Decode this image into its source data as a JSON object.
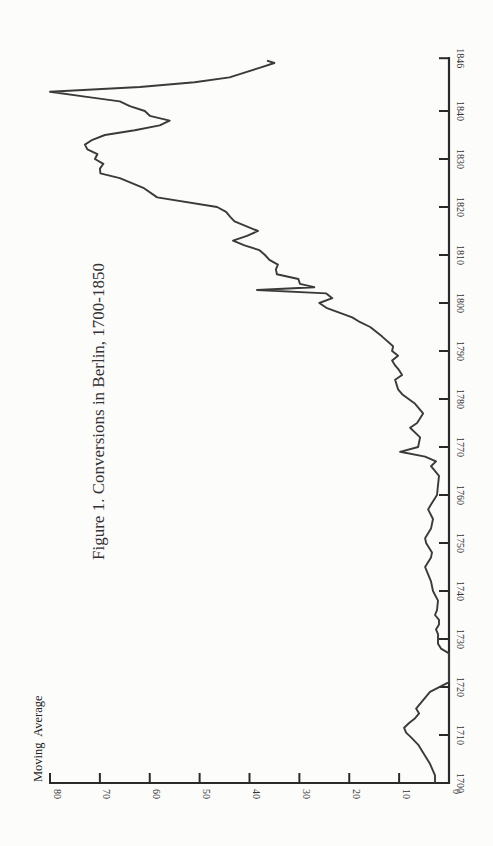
{
  "chart_data": {
    "type": "line",
    "orientation": "rotated-90-ccw",
    "title": "Figure 1. Conversions in Berlin, 1700-1850",
    "xlabel": "",
    "ylabel": "Moving  Average",
    "xlim": [
      1700,
      1851
    ],
    "ylim": [
      0,
      80
    ],
    "x_ticks": [
      {
        "value": 1700,
        "label": "1700"
      },
      {
        "value": 1710,
        "label": "1710"
      },
      {
        "value": 1720,
        "label": "1720"
      },
      {
        "value": 1730,
        "label": "1730"
      },
      {
        "value": 1740,
        "label": "1740"
      },
      {
        "value": 1750,
        "label": "1750"
      },
      {
        "value": 1760,
        "label": "1760"
      },
      {
        "value": 1770,
        "label": "1770"
      },
      {
        "value": 1780,
        "label": "1780"
      },
      {
        "value": 1790,
        "label": "1790"
      },
      {
        "value": 1800,
        "label": "1800"
      },
      {
        "value": 1810,
        "label": "1810"
      },
      {
        "value": 1820,
        "label": "1820"
      },
      {
        "value": 1830,
        "label": "1830"
      },
      {
        "value": 1840,
        "label": "1840"
      },
      {
        "value": 1851,
        "label": "1846"
      }
    ],
    "y_ticks": [
      0,
      10,
      20,
      30,
      40,
      50,
      60,
      70,
      80
    ],
    "grid": false,
    "legend": "none",
    "series": [
      {
        "name": "Moving Average",
        "x": [
          1700,
          1701.6,
          1704,
          1706,
          1708,
          1709.5,
          1710.5,
          1711.5,
          1712.5,
          1713.5,
          1714.5,
          1715.5,
          1717,
          1719,
          1721,
          1724,
          1727,
          1728,
          1729,
          1731,
          1732,
          1733,
          1734,
          1735,
          1736,
          1738,
          1740,
          1742,
          1744,
          1745,
          1747,
          1748,
          1750,
          1751,
          1753,
          1755,
          1757,
          1758,
          1760,
          1762,
          1764,
          1766,
          1767,
          1768,
          1769,
          1770,
          1772,
          1774,
          1775,
          1777,
          1779,
          1781,
          1782,
          1784,
          1785,
          1786,
          1787,
          1788,
          1789,
          1790,
          1791,
          1793,
          1795,
          1796,
          1797,
          1798,
          1799,
          1800,
          1801,
          1802,
          1802.7,
          1803.3,
          1804,
          1805,
          1806,
          1807,
          1808,
          1809,
          1810,
          1811,
          1812,
          1813,
          1814,
          1815,
          1817,
          1818,
          1819,
          1820,
          1822,
          1824,
          1826,
          1827,
          1828,
          1829,
          1830,
          1831,
          1832,
          1833,
          1834,
          1835,
          1836,
          1837,
          1838,
          1839,
          1840,
          1841,
          1842,
          1843,
          1844,
          1845,
          1846,
          1847,
          1848,
          1849,
          1850,
          1850.5
        ],
        "values": [
          2.8,
          2.8,
          3.8,
          5.0,
          6.2,
          7.6,
          8.6,
          9.0,
          8.0,
          6.8,
          6.0,
          6.6,
          5.4,
          3.8,
          0,
          0,
          0,
          1.6,
          2.2,
          2.2,
          2.6,
          2.0,
          2.0,
          2.8,
          2.4,
          2.2,
          3.2,
          3.6,
          4.4,
          4.8,
          3.6,
          3.4,
          4.6,
          4.8,
          3.6,
          3.2,
          4.2,
          3.6,
          2.4,
          2.2,
          2.0,
          3.6,
          2.6,
          4.8,
          9.8,
          6.2,
          5.8,
          7.8,
          6.4,
          5.2,
          6.8,
          9.4,
          10.2,
          10.8,
          9.4,
          10.0,
          10.8,
          11.4,
          10.2,
          11.4,
          11.2,
          13.4,
          15.8,
          17.8,
          19.4,
          22.0,
          24.6,
          26.0,
          23.4,
          24.6,
          38.5,
          27.0,
          29.9,
          30.2,
          34.5,
          34.7,
          34.3,
          36.0,
          36.9,
          38.0,
          41.0,
          43.3,
          40.5,
          38.3,
          43.0,
          43.9,
          44.7,
          46.5,
          58.5,
          61.3,
          66.0,
          69.9,
          70.0,
          69.3,
          71.0,
          70.5,
          72.5,
          73.0,
          71.5,
          69.0,
          63.0,
          58.0,
          56.0,
          60.0,
          61.0,
          64.0,
          66.0,
          73.0,
          80.0,
          62.0,
          51.0,
          44.0,
          41.0,
          38.0,
          35.0,
          36.5
        ]
      }
    ]
  }
}
